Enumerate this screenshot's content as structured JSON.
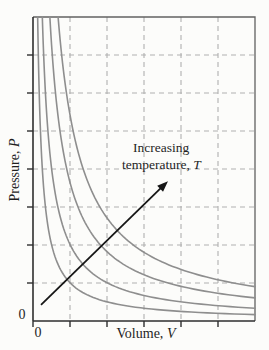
{
  "chart_data": {
    "type": "line",
    "title": "",
    "xlabel": "Volume, V",
    "ylabel": "Pressure, P",
    "x_origin_label": "0",
    "y_origin_label": "0",
    "xlim": [
      0,
      1
    ],
    "ylim": [
      0,
      1
    ],
    "grid": "dashed",
    "grid_divisions": {
      "x": 6,
      "y": 8
    },
    "series": [
      {
        "name": "isotherm-lowest-T",
        "pv_constant": 0.021
      },
      {
        "name": "isotherm-low-T",
        "pv_constant": 0.042
      },
      {
        "name": "isotherm-high-T",
        "pv_constant": 0.076
      },
      {
        "name": "isotherm-highest-T",
        "pv_constant": 0.113
      }
    ],
    "annotation": {
      "line1": "Increasing",
      "line2_prefix": "temperature, ",
      "line2_symbol": "T",
      "arrow_from": [
        0.036,
        0.053
      ],
      "arrow_to": [
        0.608,
        0.46
      ]
    },
    "labels": {
      "xlabel_prefix": "Volume, ",
      "xlabel_symbol": "V",
      "ylabel_prefix": "Pressure, ",
      "ylabel_symbol": "P"
    },
    "colors": {
      "curve": "#8e8e8e",
      "grid": "#b0b0b0",
      "axis": "#2e2e2e",
      "frame": "#616161",
      "arrow": "#161616",
      "text": "#1f1f1f",
      "background": "#fcfcfa"
    }
  }
}
